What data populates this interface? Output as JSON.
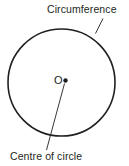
{
  "figure": {
    "type": "geometry-diagram",
    "background_color": "#ffffff",
    "stroke_color": "#231f20",
    "labels": {
      "circumference": "Circumference",
      "centre_of_circle": "Centre of circle",
      "centre_point": "O"
    },
    "geometry": {
      "circle": {
        "center_x": 61.5,
        "center_y": 82.5,
        "radius": 53.5,
        "stroke_width": 1.6
      },
      "centre_dot": {
        "x": 65.5,
        "y": 80.5,
        "radius": 2.2
      },
      "leader_circumference": {
        "x1": 103,
        "y1": 18.5,
        "x2": 95.5,
        "y2": 33.5
      },
      "leader_centre": {
        "x1": 64.5,
        "y1": 83.5,
        "x2": 46.5,
        "y2": 150
      }
    }
  }
}
